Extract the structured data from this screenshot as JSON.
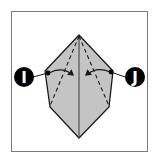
{
  "diagram": {
    "type": "origami-fold-step",
    "markers": [
      {
        "id": "I",
        "label": "I"
      },
      {
        "id": "J",
        "label": "J"
      }
    ],
    "colors": {
      "paper": "#c4c4c4",
      "outline": "#1a1a1a",
      "frame": "#7a7a7a",
      "marker_bg": "#000000",
      "marker_text": "#ffffff"
    }
  }
}
